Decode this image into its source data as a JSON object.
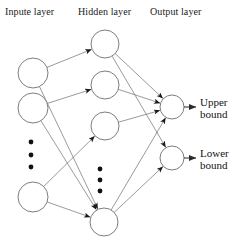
{
  "diagram": {
    "layer_labels": {
      "input": "Inpute layer",
      "hidden": "Hidden layer",
      "output": "Output layer"
    },
    "output_labels": {
      "upper_line1": "Upper",
      "upper_line2": "bound",
      "lower_line1": "Lower",
      "lower_line2": "bound"
    },
    "colors": {
      "node_stroke": "#6e6e6e",
      "edge_stroke": "#6e6e6e",
      "arrow_stroke": "#2b2b2b",
      "dot_fill": "#111111",
      "text": "#141414",
      "background": "#ffffff"
    },
    "layers": [
      {
        "name": "input",
        "node_radius": 15,
        "ellipsis": {
          "x": 31,
          "ys": [
            142,
            155,
            167
          ],
          "r": 2.4
        },
        "nodes": [
          {
            "id": "i1",
            "cx": 33,
            "cy": 73
          },
          {
            "id": "i2",
            "cx": 33,
            "cy": 108
          },
          {
            "id": "i3",
            "cx": 33,
            "cy": 197
          }
        ]
      },
      {
        "name": "hidden",
        "node_radius": 14,
        "ellipsis": {
          "x": 100,
          "ys": [
            169,
            180,
            191
          ],
          "r": 2.4
        },
        "nodes": [
          {
            "id": "h1",
            "cx": 105,
            "cy": 44
          },
          {
            "id": "h2",
            "cx": 105,
            "cy": 85
          },
          {
            "id": "h3",
            "cx": 105,
            "cy": 126
          },
          {
            "id": "h4",
            "cx": 104,
            "cy": 222
          }
        ]
      },
      {
        "name": "output",
        "node_radius": 12,
        "ellipsis": null,
        "nodes": [
          {
            "id": "o1",
            "cx": 172,
            "cy": 107
          },
          {
            "id": "o2",
            "cx": 172,
            "cy": 158
          }
        ]
      }
    ],
    "edges_input_hidden": [
      {
        "from": "i1",
        "to": "h1"
      },
      {
        "from": "i1",
        "to": "h4"
      },
      {
        "from": "i2",
        "to": "h2"
      },
      {
        "from": "i2",
        "to": "h4"
      },
      {
        "from": "i3",
        "to": "h3"
      },
      {
        "from": "i3",
        "to": "h4"
      }
    ],
    "edges_hidden_output": [
      {
        "from": "h1",
        "to": "o1"
      },
      {
        "from": "h1",
        "to": "o2"
      },
      {
        "from": "h2",
        "to": "o1"
      },
      {
        "from": "h3",
        "to": "o1"
      },
      {
        "from": "h4",
        "to": "o1"
      },
      {
        "from": "h4",
        "to": "o2"
      }
    ],
    "output_arrows": [
      {
        "from": "o1",
        "x1": 184,
        "y1": 107,
        "x2": 196,
        "y2": 107
      },
      {
        "from": "o2",
        "x1": 184,
        "y1": 158,
        "x2": 196,
        "y2": 158
      }
    ]
  }
}
